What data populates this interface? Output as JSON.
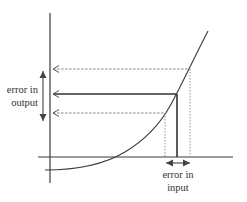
{
  "diagram": {
    "title": "",
    "type": "error propagation through a function",
    "labels": {
      "output_error_line1": "error in",
      "output_error_line2": "output",
      "input_error_line1": "error in",
      "input_error_line2": "input"
    },
    "colors": {
      "line": "#3a3a3a",
      "dashed": "#777777",
      "text": "#333333",
      "background": "#ffffff"
    },
    "elements": [
      {
        "name": "y-axis",
        "style": "solid"
      },
      {
        "name": "x-axis",
        "style": "solid"
      },
      {
        "name": "curve",
        "style": "solid"
      },
      {
        "name": "upper-bound-projection",
        "style": "dashed"
      },
      {
        "name": "nominal-projection",
        "style": "solid"
      },
      {
        "name": "lower-bound-projection",
        "style": "dashed"
      },
      {
        "name": "output-error-arrow",
        "style": "double-arrow"
      },
      {
        "name": "input-error-arrow",
        "style": "double-arrow"
      }
    ]
  }
}
